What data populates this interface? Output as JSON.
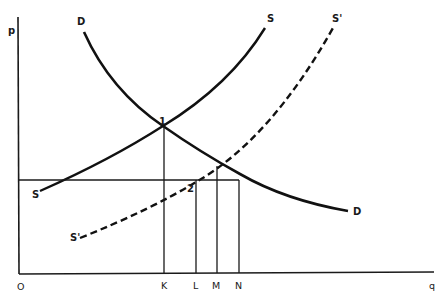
{
  "diagram": {
    "type": "supply-demand",
    "axes": {
      "y_label": "p",
      "x_label": "q",
      "origin_label": "O"
    },
    "curves": [
      {
        "name": "D",
        "label_top": "D",
        "label_end": "D",
        "style": "solid"
      },
      {
        "name": "S",
        "label_top": "S",
        "label_end": "S",
        "style": "solid"
      },
      {
        "name": "S'",
        "label_top": "S'",
        "label_end": "S'",
        "style": "dashed"
      }
    ],
    "points": {
      "p1": "1",
      "p2": "2"
    },
    "x_ticks": [
      "K",
      "L",
      "M",
      "N"
    ]
  }
}
